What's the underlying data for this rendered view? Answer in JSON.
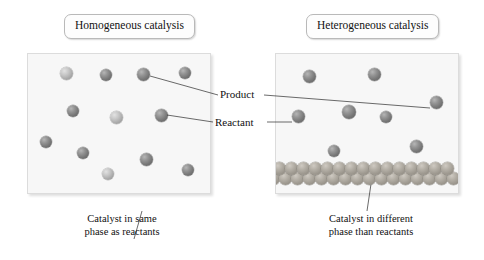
{
  "figure": {
    "kind": "catalysis-comparison-diagram",
    "background_color": "#ffffff"
  },
  "panels": {
    "left": {
      "title": "Homogeneous catalysis",
      "caption": "Catalyst in same\nphase as reactants",
      "panel_color": "#f7f7f7",
      "spheres": [
        {
          "x": 38,
          "y": 19,
          "r": 6.5,
          "shade": "light"
        },
        {
          "x": 78,
          "y": 21,
          "r": 6.0,
          "shade": "dark"
        },
        {
          "x": 115,
          "y": 20,
          "r": 6.5,
          "shade": "dark"
        },
        {
          "x": 157,
          "y": 19,
          "r": 6.0,
          "shade": "dark"
        },
        {
          "x": 45,
          "y": 57,
          "r": 6.0,
          "shade": "dark"
        },
        {
          "x": 88,
          "y": 63,
          "r": 6.5,
          "shade": "light"
        },
        {
          "x": 133,
          "y": 61,
          "r": 6.5,
          "shade": "dark"
        },
        {
          "x": 18,
          "y": 88,
          "r": 6.0,
          "shade": "dark"
        },
        {
          "x": 55,
          "y": 99,
          "r": 6.0,
          "shade": "dark"
        },
        {
          "x": 118,
          "y": 105,
          "r": 6.5,
          "shade": "dark"
        },
        {
          "x": 160,
          "y": 116,
          "r": 6.0,
          "shade": "dark"
        },
        {
          "x": 80,
          "y": 120,
          "r": 6.0,
          "shade": "light"
        }
      ],
      "pointer": {
        "from_x": 107,
        "from_y": 186,
        "to_x": 115,
        "to_y": 211
      }
    },
    "right": {
      "title": "Heterogeneous catalysis",
      "caption": "Catalyst in different\nphase than reactants",
      "panel_color": "#f7f7f7",
      "spheres": [
        {
          "x": 33,
          "y": 22,
          "r": 6.5,
          "shade": "dark"
        },
        {
          "x": 98,
          "y": 20,
          "r": 6.5,
          "shade": "dark"
        },
        {
          "x": 160,
          "y": 48,
          "r": 6.5,
          "shade": "dark"
        },
        {
          "x": 22,
          "y": 62,
          "r": 6.5,
          "shade": "dark"
        },
        {
          "x": 73,
          "y": 58,
          "r": 7.0,
          "shade": "dark"
        },
        {
          "x": 110,
          "y": 63,
          "r": 6.0,
          "shade": "dark"
        },
        {
          "x": 58,
          "y": 97,
          "r": 6.0,
          "shade": "dark"
        },
        {
          "x": 140,
          "y": 92,
          "r": 6.5,
          "shade": "dark"
        }
      ],
      "catalyst_bed": {
        "rows": 2,
        "spheres_per_row": 14,
        "sphere_radius": 6.6,
        "color": "#a9a49b",
        "top_y": 108
      },
      "pointer": {
        "from_x": 96,
        "from_y": 131,
        "to_x": 92,
        "to_y": 211
      }
    }
  },
  "labels": {
    "product": "Product",
    "reactant": "Reactant"
  },
  "leader_lines": [
    {
      "name": "product-to-left-sphere",
      "x1": 218,
      "y1": 95,
      "x2": 150,
      "y2": 76
    },
    {
      "name": "product-to-right-sphere",
      "x1": 264,
      "y1": 95,
      "x2": 430,
      "y2": 108
    },
    {
      "name": "reactant-to-left-sphere",
      "x1": 213,
      "y1": 122,
      "x2": 167,
      "y2": 115
    },
    {
      "name": "reactant-to-right-sphere",
      "x1": 267,
      "y1": 122,
      "x2": 292,
      "y2": 122
    }
  ]
}
